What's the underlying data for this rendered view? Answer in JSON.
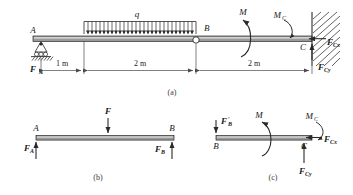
{
  "figure": {
    "title_text": "Beam free-body diagram set",
    "panels": [
      {
        "id": "a",
        "label": "(a)"
      },
      {
        "id": "b",
        "label": "(b)"
      },
      {
        "id": "c",
        "label": "(c)"
      }
    ]
  },
  "panel_a": {
    "label": "(a)",
    "points": {
      "A": "A",
      "B": "B",
      "C": "C"
    },
    "distributed_load": {
      "symbol": "q"
    },
    "moment_applied": {
      "symbol": "M"
    },
    "moment_reaction": {
      "symbol": "M",
      "sub": "C"
    },
    "reaction_a": {
      "symbol": "F",
      "sub": "A"
    },
    "reaction_cx": {
      "symbol": "F",
      "sub": "Cx"
    },
    "reaction_cy": {
      "symbol": "F",
      "sub": "Cy"
    },
    "dimensions": [
      {
        "value": "1 m"
      },
      {
        "value": "2 m"
      },
      {
        "value": "2 m"
      }
    ],
    "supports": {
      "a_type": "roller-pin-support-icon",
      "c_type": "fixed-support-icon",
      "b_type": "hinge-icon"
    }
  },
  "panel_b": {
    "label": "(b)",
    "points": {
      "A": "A",
      "B": "B"
    },
    "load_f": {
      "symbol": "F"
    },
    "reaction_a": {
      "symbol": "F",
      "sub": "A"
    },
    "reaction_b": {
      "symbol": "F",
      "sub": "B"
    }
  },
  "panel_c": {
    "label": "(c)",
    "points": {
      "B": "B",
      "C": "C"
    },
    "force_b_prime": {
      "symbol": "F",
      "prime": "′",
      "sub": "B"
    },
    "moment_applied": {
      "symbol": "M"
    },
    "moment_reaction": {
      "symbol": "M",
      "sub": "C"
    },
    "reaction_cx": {
      "symbol": "F",
      "sub": "Cx"
    },
    "reaction_cy": {
      "symbol": "F",
      "sub": "Cy"
    }
  },
  "colors": {
    "beam_fill": "#9a9a9a",
    "beam_highlight": "#d8d8d8",
    "line": "#2a2a2a",
    "text": "#1a1a1a",
    "panel_label": "#3a3a3a",
    "background": "#ffffff"
  }
}
